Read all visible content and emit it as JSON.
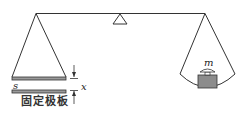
{
  "diagram": {
    "type": "balance-with-capacitor",
    "labels": {
      "plate_area": "s",
      "gap": "x",
      "mass": "m",
      "fixed_plate": "固定极板"
    },
    "colors": {
      "line": "#333333",
      "plate_fill": "#9a9a9a",
      "weight_fill": "#8c8c8c"
    }
  }
}
